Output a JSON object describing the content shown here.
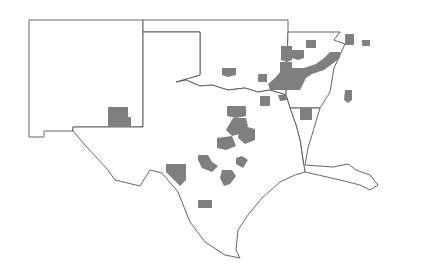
{
  "map": {
    "title": "",
    "colors": {
      "background": "#ffffff",
      "border": "#555555",
      "highlight": "#7f7f7f"
    },
    "states": [
      {
        "name": "New Mexico",
        "points": "29,20 143,20 143,127 73,127 73,131 44,131 44,137 29,137"
      },
      {
        "name": "Oklahoma",
        "points": "143,20 288,20 288,32 286,95 270,90 258,92 245,88 228,90 212,85 200,86 186,80 176,82 200,75 200,32 143,32"
      },
      {
        "name": "Arkansas",
        "points": "288,32 340,32 334,40 345,44 334,68 330,92 320,108 290,108 286,95"
      },
      {
        "name": "Louisiana",
        "points": "290,108 320,108 315,125 308,148 305,165 333,167 348,164 356,170 370,175 378,185 370,190 360,185 340,180 305,172 303,160 300,140 296,125"
      },
      {
        "name": "Texas",
        "points": "143,32 200,32 200,75 176,82 186,80 200,86 212,85 228,90 245,88 258,92 270,90 286,95 290,108 296,125 300,140 303,160 305,172 295,175 280,182 262,198 248,215 238,230 236,250 240,258 225,255 205,242 190,222 178,192 162,173 150,170 140,186 115,180 108,170 85,145 73,131 73,127 143,127"
      }
    ],
    "counties": [
      {
        "state": "New Mexico",
        "points": "108,107 128,107 128,117 131,117 131,127 108,127"
      },
      {
        "state": "Oklahoma",
        "points": "222,68 236,68 236,75 228,77 222,75"
      },
      {
        "state": "Oklahoma",
        "points": "258,74 267,74 267,82 258,82"
      },
      {
        "state": "Oklahoma",
        "points": "281,46 292,46 292,60 287,62 281,60"
      },
      {
        "state": "Oklahoma",
        "points": "280,62 292,62 292,90 270,90 268,84 275,78 280,72"
      },
      {
        "state": "Arkansas",
        "points": "306,40 316,40 316,48 306,48"
      },
      {
        "state": "Arkansas",
        "points": "292,50 304,50 304,58 298,60 292,58"
      },
      {
        "state": "Arkansas",
        "points": "345,34 354,34 354,45 345,45"
      },
      {
        "state": "Arkansas",
        "points": "362,40 370,40 370,46 362,46"
      },
      {
        "state": "Arkansas",
        "points": "330,52 340,52 340,58 332,64 324,70 312,74 306,78 300,90 292,90 292,68 304,68 316,64 324,58"
      },
      {
        "state": "Arkansas",
        "points": "345,90 352,90 352,100 348,103 344,100"
      },
      {
        "state": "Oklahoma",
        "points": "278,95 287,95 287,100 280,101"
      },
      {
        "state": "Texas",
        "points": "260,96 270,96 270,106 260,106"
      },
      {
        "state": "Texas",
        "points": "300,108 312,108 312,120 300,120"
      },
      {
        "state": "Texas",
        "points": "227,106 246,106 246,116 236,118 227,116"
      },
      {
        "state": "Texas",
        "points": "233,118 246,118 248,126 240,134 232,136 226,130"
      },
      {
        "state": "Texas",
        "points": "217,138 232,136 236,146 226,150 217,148"
      },
      {
        "state": "Texas",
        "points": "240,125 255,129 255,140 245,144 238,138"
      },
      {
        "state": "Texas",
        "points": "198,155 208,155 212,162 218,166 212,172 202,168 198,160"
      },
      {
        "state": "Texas",
        "points": "236,158 242,156 248,160 243,168 236,164"
      },
      {
        "state": "Texas",
        "points": "222,170 232,170 236,176 230,184 224,186 220,178"
      },
      {
        "state": "Texas",
        "points": "166,164 186,164 186,180 180,186 170,176 166,172"
      },
      {
        "state": "Texas",
        "points": "198,200 212,200 212,208 198,208"
      }
    ]
  }
}
